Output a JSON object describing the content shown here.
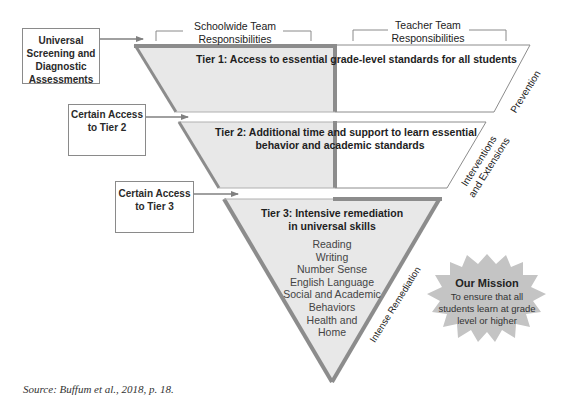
{
  "diagram": {
    "column_headers": {
      "schoolwide": "Schoolwide Team Responsibilities",
      "schoolwide_lines": [
        "Schoolwide Team",
        "Responsibilities"
      ],
      "teacher": "Teacher Team Responsibilities",
      "teacher_lines": [
        "Teacher Team",
        "Responsibilities"
      ]
    },
    "entry_boxes": [
      {
        "id": "universal-screening",
        "lines": [
          "Universal",
          "Screening and",
          "Diagnostic",
          "Assessments"
        ]
      },
      {
        "id": "certain-access-tier-2",
        "lines": [
          "Certain Access",
          "to Tier 2"
        ]
      },
      {
        "id": "certain-access-tier-3",
        "lines": [
          "Certain Access",
          "to Tier 3"
        ]
      }
    ],
    "tiers": [
      {
        "name": "Tier 1",
        "title": "Tier 1: Access to essential grade-level standards for all students",
        "side_label": "Prevention"
      },
      {
        "name": "Tier 2",
        "title_lines": [
          "Tier 2: Additional time and support to learn essential",
          "behavior and academic standards"
        ],
        "side_label_lines": [
          "Interventions",
          "and Extensions"
        ]
      },
      {
        "name": "Tier 3",
        "title_lines": [
          "Tier 3: Intensive remediation",
          "in universal skills"
        ],
        "skills": [
          "Reading",
          "Writing",
          "Number Sense",
          "English Language",
          "Social and Academic",
          "Behaviors",
          "Health and",
          "Home"
        ],
        "side_label": "Intense Remediation"
      }
    ],
    "mission": {
      "title": "Our Mission",
      "lines": [
        "To ensure that all",
        "students learn at grade",
        "level or higher"
      ],
      "emphasis_word": "all"
    },
    "colors": {
      "fill_gray": "#e8e8e8",
      "border_gray": "#8c8c8c",
      "starburst_gray": "#c4c4c4",
      "line_gray": "#777777"
    }
  },
  "source": "Source: Buffum et al., 2018, p. 18."
}
